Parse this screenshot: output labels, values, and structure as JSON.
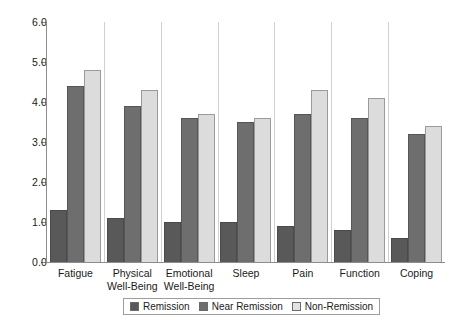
{
  "chart_data": {
    "type": "bar",
    "title": "",
    "xlabel": "",
    "ylabel": "",
    "ylim": [
      0.0,
      6.0
    ],
    "ytick_labels": [
      "0.0",
      "1.0",
      "2.0",
      "3.0",
      "4.0",
      "5.0",
      "6.0"
    ],
    "ytick_values": [
      0.0,
      1.0,
      2.0,
      3.0,
      4.0,
      5.0,
      6.0
    ],
    "grid": false,
    "legend_position": "bottom-center",
    "categories": [
      "Fatigue",
      "Physical Well-Being",
      "Emotional Well-Being",
      "Sleep",
      "Pain",
      "Function",
      "Coping"
    ],
    "category_lines": [
      [
        "Fatigue"
      ],
      [
        "Physical",
        "Well-Being"
      ],
      [
        "Emotional",
        "Well-Being"
      ],
      [
        "Sleep"
      ],
      [
        "Pain"
      ],
      [
        "Function"
      ],
      [
        "Coping"
      ]
    ],
    "series": [
      {
        "name": "Remission",
        "color": "#595959",
        "values": [
          1.3,
          1.1,
          1.0,
          1.0,
          0.9,
          0.8,
          0.6
        ]
      },
      {
        "name": "Near Remission",
        "color": "#6e6e6e",
        "values": [
          4.4,
          3.9,
          3.6,
          3.5,
          3.7,
          3.6,
          3.2
        ]
      },
      {
        "name": "Non-Remission",
        "color": "#dcdcdc",
        "values": [
          4.8,
          4.3,
          3.7,
          3.6,
          4.3,
          4.1,
          3.4
        ]
      }
    ]
  },
  "legend": {
    "items": [
      {
        "label": "Remission",
        "swatch": "s0"
      },
      {
        "label": "Near Remission",
        "swatch": "s1"
      },
      {
        "label": "Non-Remission",
        "swatch": "s2"
      }
    ]
  },
  "caption": {
    "text": ""
  }
}
